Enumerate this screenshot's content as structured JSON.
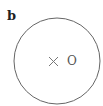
{
  "panel": {
    "label": "b"
  },
  "diagram": {
    "shape": "circle",
    "center_marker": "cross-icon",
    "center_label": "O",
    "stroke_color": "#666666",
    "circle": {
      "cx": 57,
      "cy": 61,
      "r": 43
    }
  }
}
